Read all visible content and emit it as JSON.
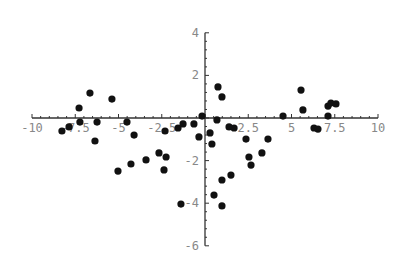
{
  "chart_data": {
    "type": "scatter",
    "title": "",
    "xlabel": "",
    "ylabel": "",
    "xlim": [
      -10,
      10
    ],
    "ylim": [
      -6,
      4
    ],
    "grid": false,
    "legend": null,
    "x_ticks": [
      -10,
      -7.5,
      -5,
      -2.5,
      2.5,
      5,
      7.5,
      10
    ],
    "x_tick_labels": [
      "-10",
      "-7.5",
      "-5",
      "-2.5",
      "2.5",
      "5",
      "7.5",
      "10"
    ],
    "y_ticks": [
      4,
      2,
      -2,
      -4,
      -6
    ],
    "y_tick_labels": [
      "4",
      "2",
      "-2",
      "-4",
      "-6"
    ],
    "point_color": "#111111",
    "axis_color": "#333333",
    "points": [
      {
        "x": -8.27,
        "y": -0.61
      },
      {
        "x": -7.86,
        "y": -0.42
      },
      {
        "x": -7.28,
        "y": 0.47
      },
      {
        "x": -7.23,
        "y": -0.19
      },
      {
        "x": -6.65,
        "y": 1.17
      },
      {
        "x": -6.24,
        "y": -0.19
      },
      {
        "x": -6.36,
        "y": -1.08
      },
      {
        "x": -5.38,
        "y": 0.89
      },
      {
        "x": -4.51,
        "y": -0.19
      },
      {
        "x": -4.1,
        "y": -0.8
      },
      {
        "x": -5.03,
        "y": -2.49
      },
      {
        "x": -4.28,
        "y": -2.16
      },
      {
        "x": -3.41,
        "y": -1.97
      },
      {
        "x": -2.66,
        "y": -1.64
      },
      {
        "x": -2.25,
        "y": -1.83
      },
      {
        "x": -2.37,
        "y": -2.44
      },
      {
        "x": -2.31,
        "y": -0.61
      },
      {
        "x": -1.56,
        "y": -0.47
      },
      {
        "x": -1.27,
        "y": -0.28
      },
      {
        "x": -0.64,
        "y": -0.28
      },
      {
        "x": -1.39,
        "y": -4.04
      },
      {
        "x": -0.35,
        "y": -0.89
      },
      {
        "x": -0.17,
        "y": 0.09
      },
      {
        "x": 0.75,
        "y": 1.46
      },
      {
        "x": 0.98,
        "y": 0.99
      },
      {
        "x": 0.69,
        "y": -0.09
      },
      {
        "x": 0.29,
        "y": -0.7
      },
      {
        "x": 0.4,
        "y": -1.22
      },
      {
        "x": 1.39,
        "y": -0.42
      },
      {
        "x": 1.68,
        "y": -0.47
      },
      {
        "x": 2.37,
        "y": -0.99
      },
      {
        "x": 2.54,
        "y": -1.83
      },
      {
        "x": 2.66,
        "y": -2.21
      },
      {
        "x": 3.29,
        "y": -1.64
      },
      {
        "x": 3.64,
        "y": -0.99
      },
      {
        "x": 1.5,
        "y": -2.68
      },
      {
        "x": 0.98,
        "y": -2.91
      },
      {
        "x": 0.52,
        "y": -3.62
      },
      {
        "x": 0.98,
        "y": -4.13
      },
      {
        "x": 4.51,
        "y": 0.09
      },
      {
        "x": 5.55,
        "y": 1.31
      },
      {
        "x": 5.66,
        "y": 0.38
      },
      {
        "x": 6.3,
        "y": -0.47
      },
      {
        "x": 6.53,
        "y": -0.52
      },
      {
        "x": 7.11,
        "y": 0.56
      },
      {
        "x": 7.28,
        "y": 0.7
      },
      {
        "x": 7.57,
        "y": 0.66
      },
      {
        "x": 7.11,
        "y": 0.09
      }
    ]
  }
}
